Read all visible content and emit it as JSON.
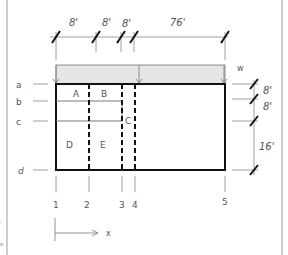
{
  "diagram": {
    "type": "structural-plan",
    "top_dimensions": [
      "8'",
      "8'",
      "8'",
      "76'"
    ],
    "right_dimensions": [
      "8'",
      "8'",
      "16'"
    ],
    "row_labels": [
      "a",
      "b",
      "c",
      "d"
    ],
    "column_labels": [
      "1",
      "2",
      "3",
      "4",
      "5"
    ],
    "panel_labels": [
      "A",
      "B",
      "C",
      "D",
      "E"
    ],
    "load_label": "w",
    "axis_label": "x",
    "colors": {
      "line": "#111111",
      "thin_line": "#777777",
      "load_fill": "#e6e6e6",
      "border": "#999999"
    }
  }
}
